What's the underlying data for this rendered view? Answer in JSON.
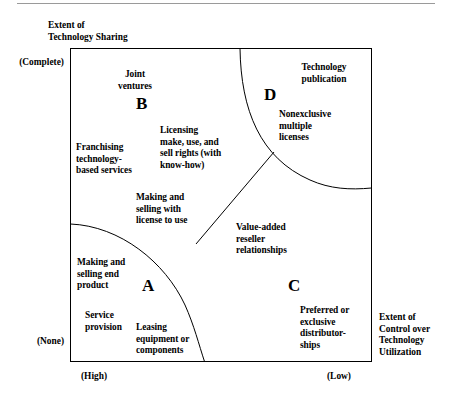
{
  "figure": {
    "y_axis": {
      "title": "Extent of\nTechnology Sharing",
      "title_line1": "Extent of",
      "title_line2": "Technology Sharing",
      "top_tick": "(Complete)",
      "bottom_tick": "(None)"
    },
    "x_axis": {
      "title_line1": "Extent of",
      "title_line2": "Control over",
      "title_line3": "Technology",
      "title_line4": "Utilization",
      "left_tick": "(High)",
      "right_tick": "(Low)"
    },
    "quadrants": [
      {
        "letter": "A",
        "name": "quadrant-a"
      },
      {
        "letter": "B",
        "name": "quadrant-b"
      },
      {
        "letter": "C",
        "name": "quadrant-c"
      },
      {
        "letter": "D",
        "name": "quadrant-d"
      }
    ],
    "items": [
      {
        "id": "joint-ventures",
        "text": "Joint\nventures",
        "line1": "Joint",
        "line2": "ventures"
      },
      {
        "id": "franchising",
        "text": "Franchising\ntechnology-\nbased services",
        "line1": "Franchising",
        "line2": "technology-",
        "line3": "based services"
      },
      {
        "id": "licensing",
        "text": "Licensing\nmake, use, and\nsell rights (with\nknow-how)",
        "line1": "Licensing",
        "line2": "make, use, and",
        "line3": "sell rights (with",
        "line4": "know-how)"
      },
      {
        "id": "technology-publication",
        "text": "Technology\npublication",
        "line1": "Technology",
        "line2": "publication"
      },
      {
        "id": "nonexclusive-licenses",
        "text": "Nonexclusive\nmultiple\nlicenses",
        "line1": "Nonexclusive",
        "line2": "multiple",
        "line3": "licenses"
      },
      {
        "id": "making-selling-license",
        "text": "Making and\nselling with\nlicense to use",
        "line1": "Making and",
        "line2": "selling with",
        "line3": "license to use"
      },
      {
        "id": "value-added-reseller",
        "text": "Value-added\nreseller\nrelationships",
        "line1": "Value-added",
        "line2": "reseller",
        "line3": "relationships"
      },
      {
        "id": "making-selling-end-product",
        "text": "Making and\nselling end\nproduct",
        "line1": "Making and",
        "line2": "selling end",
        "line3": "product"
      },
      {
        "id": "service-provision",
        "text": "Service\nprovision",
        "line1": "Service",
        "line2": "provision"
      },
      {
        "id": "leasing-equipment",
        "text": "Leasing\nequipment or\ncomponents",
        "line1": "Leasing",
        "line2": "equipment or",
        "line3": "components"
      },
      {
        "id": "preferred-exclusive-distributorships",
        "text": "Preferred or\nexclusive\ndistributor-\nships",
        "line1": "Preferred or",
        "line2": "exclusive",
        "line3": "distributor-",
        "line4": "ships"
      }
    ],
    "colors": {
      "line": "#000000",
      "rule": "#9a9a9a",
      "background": "#ffffff"
    }
  }
}
